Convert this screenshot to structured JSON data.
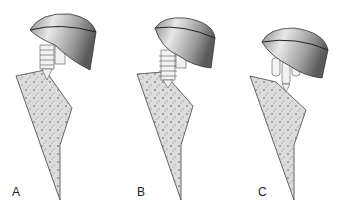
{
  "figure": {
    "panels": [
      {
        "id": "A",
        "label": "A",
        "stem_type": "threaded-screw-with-cone"
      },
      {
        "id": "B",
        "label": "B",
        "stem_type": "threaded-screw"
      },
      {
        "id": "C",
        "label": "C",
        "stem_type": "multiple-pegs"
      }
    ],
    "colors": {
      "cap_light": "#e6e6e6",
      "cap_dark": "#6e6e6e",
      "cap_edge": "#222222",
      "bone_fill": "#d9d9d9",
      "bone_speckle": "#8a8a8a",
      "background": "#ffffff"
    }
  }
}
